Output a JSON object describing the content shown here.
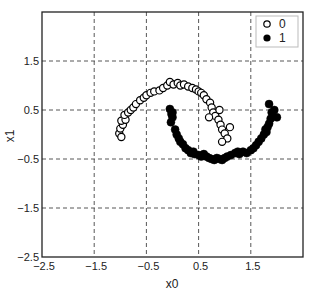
{
  "chart_data": {
    "type": "scatter",
    "title": "",
    "xlabel": "x0",
    "ylabel": "x1",
    "xlim": [
      -2.5,
      2.5
    ],
    "ylim": [
      -2.5,
      2.5
    ],
    "xticks": [
      -2.5,
      -1.5,
      -0.5,
      0.5,
      1.5
    ],
    "yticks": [
      -2.5,
      -1.5,
      -0.5,
      0.5,
      1.5
    ],
    "xtick_labels": [
      "−2.5",
      "−1.5",
      "−0.5",
      "0.5",
      "1.5"
    ],
    "ytick_labels": [
      "−2.5",
      "−1.5",
      "−0.5",
      "0.5",
      "1.5"
    ],
    "grid": true,
    "grid_style": "dashed",
    "legend_position": "upper right",
    "series": [
      {
        "name": "0",
        "marker": "open-circle",
        "color": "#000000",
        "points": [
          [
            -1.02,
            0.02
          ],
          [
            -0.98,
            -0.05
          ],
          [
            -1.0,
            0.12
          ],
          [
            -0.95,
            0.2
          ],
          [
            -0.98,
            0.28
          ],
          [
            -0.9,
            0.3
          ],
          [
            -0.92,
            0.4
          ],
          [
            -0.85,
            0.45
          ],
          [
            -0.8,
            0.5
          ],
          [
            -0.75,
            0.55
          ],
          [
            -0.7,
            0.62
          ],
          [
            -0.62,
            0.7
          ],
          [
            -0.55,
            0.75
          ],
          [
            -0.5,
            0.8
          ],
          [
            -0.42,
            0.85
          ],
          [
            -0.35,
            0.88
          ],
          [
            -0.25,
            0.9
          ],
          [
            -0.18,
            0.95
          ],
          [
            -0.1,
            1.0
          ],
          [
            -0.05,
            1.07
          ],
          [
            0.02,
            1.02
          ],
          [
            0.1,
            1.05
          ],
          [
            0.15,
            1.0
          ],
          [
            0.22,
            1.02
          ],
          [
            0.3,
            0.98
          ],
          [
            0.38,
            0.95
          ],
          [
            0.45,
            0.92
          ],
          [
            0.5,
            0.88
          ],
          [
            0.55,
            0.85
          ],
          [
            0.6,
            0.8
          ],
          [
            0.65,
            0.72
          ],
          [
            0.72,
            0.65
          ],
          [
            0.75,
            0.55
          ],
          [
            0.78,
            0.45
          ],
          [
            0.82,
            0.38
          ],
          [
            0.88,
            0.3
          ],
          [
            0.92,
            0.2
          ],
          [
            0.95,
            0.1
          ],
          [
            1.0,
            0.02
          ],
          [
            1.05,
            -0.08
          ],
          [
            0.95,
            -0.15
          ],
          [
            1.1,
            0.15
          ],
          [
            0.9,
            0.5
          ],
          [
            0.7,
            0.35
          ]
        ]
      },
      {
        "name": "1",
        "marker": "filled-circle",
        "color": "#000000",
        "points": [
          [
            -0.05,
            0.52
          ],
          [
            -0.02,
            0.42
          ],
          [
            0.0,
            0.35
          ],
          [
            -0.03,
            0.25
          ],
          [
            0.05,
            0.1
          ],
          [
            0.08,
            0.0
          ],
          [
            0.12,
            -0.08
          ],
          [
            0.15,
            -0.15
          ],
          [
            0.2,
            -0.2
          ],
          [
            0.25,
            -0.28
          ],
          [
            0.3,
            -0.32
          ],
          [
            0.35,
            -0.38
          ],
          [
            0.42,
            -0.4
          ],
          [
            0.5,
            -0.42
          ],
          [
            0.55,
            -0.45
          ],
          [
            0.6,
            -0.4
          ],
          [
            0.65,
            -0.45
          ],
          [
            0.7,
            -0.48
          ],
          [
            0.75,
            -0.5
          ],
          [
            0.8,
            -0.52
          ],
          [
            0.85,
            -0.48
          ],
          [
            0.9,
            -0.5
          ],
          [
            0.95,
            -0.52
          ],
          [
            1.0,
            -0.48
          ],
          [
            1.05,
            -0.45
          ],
          [
            1.12,
            -0.42
          ],
          [
            1.2,
            -0.38
          ],
          [
            1.28,
            -0.4
          ],
          [
            1.35,
            -0.35
          ],
          [
            1.42,
            -0.38
          ],
          [
            1.5,
            -0.32
          ],
          [
            1.55,
            -0.28
          ],
          [
            1.6,
            -0.22
          ],
          [
            1.65,
            -0.15
          ],
          [
            1.7,
            -0.08
          ],
          [
            1.75,
            0.0
          ],
          [
            1.8,
            0.05
          ],
          [
            1.82,
            0.15
          ],
          [
            1.85,
            0.22
          ],
          [
            1.88,
            0.32
          ],
          [
            1.9,
            0.45
          ],
          [
            1.85,
            0.62
          ],
          [
            1.95,
            0.5
          ],
          [
            2.0,
            0.35
          ],
          [
            1.78,
            0.1
          ],
          [
            0.0,
            0.45
          ],
          [
            0.4,
            -0.35
          ],
          [
            1.25,
            -0.35
          ]
        ]
      }
    ]
  }
}
